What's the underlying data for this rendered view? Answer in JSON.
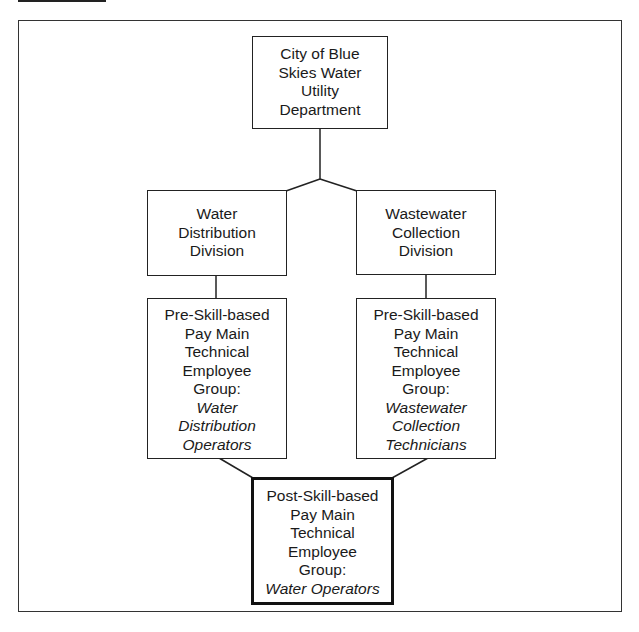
{
  "diagram": {
    "type": "org-chart",
    "colors": {
      "line": "#222222",
      "background": "#ffffff"
    },
    "nodes": {
      "root": {
        "lines": [
          "City of Blue",
          "Skies Water",
          "Utility",
          "Department"
        ]
      },
      "water_division": {
        "lines": [
          "Water",
          "Distribution",
          "Division"
        ]
      },
      "wastewater_division": {
        "lines": [
          "Wastewater",
          "Collection",
          "Division"
        ]
      },
      "water_group": {
        "lines": [
          "Pre-Skill-based",
          "Pay Main",
          "Technical",
          "Employee",
          "Group:"
        ],
        "italic_lines": [
          "Water",
          "Distribution",
          "Operators"
        ]
      },
      "wastewater_group": {
        "lines": [
          "Pre-Skill-based",
          "Pay Main",
          "Technical",
          "Employee",
          "Group:"
        ],
        "italic_lines": [
          "Wastewater",
          "Collection",
          "Technicians"
        ]
      },
      "merged_group": {
        "lines": [
          "Post-Skill-based",
          "Pay Main",
          "Technical",
          "Employee",
          "Group:"
        ],
        "italic_lines": [
          "Water Operators"
        ],
        "emphasis": "thick-border"
      }
    },
    "edges": [
      [
        "root",
        "water_division"
      ],
      [
        "root",
        "wastewater_division"
      ],
      [
        "water_division",
        "water_group"
      ],
      [
        "wastewater_division",
        "wastewater_group"
      ],
      [
        "water_group",
        "merged_group"
      ],
      [
        "wastewater_group",
        "merged_group"
      ]
    ]
  }
}
